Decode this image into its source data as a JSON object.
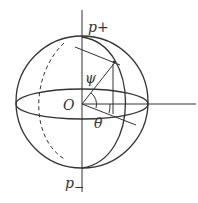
{
  "diagram": {
    "type": "poincare-sphere",
    "labels": {
      "top_pole": "p",
      "top_pole_sub": "+",
      "bottom_pole": "p",
      "bottom_pole_sub": "−",
      "origin": "O",
      "psi": "ψ",
      "theta": "θ"
    },
    "colors": {
      "stroke": "#333333",
      "background": "#ffffff"
    }
  }
}
